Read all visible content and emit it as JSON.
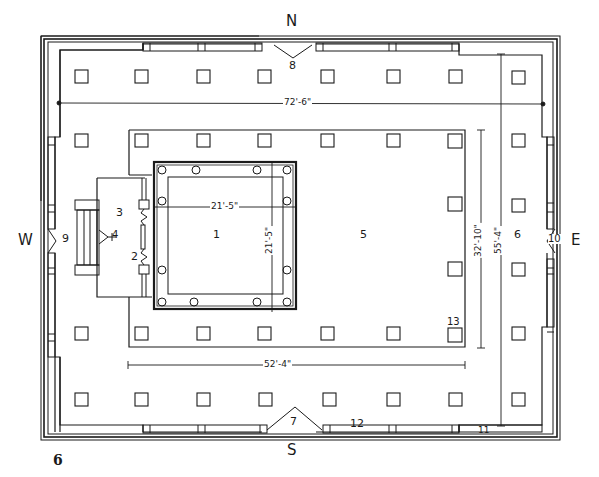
{
  "figure": {
    "figure_number": "6"
  },
  "compass": {
    "north": "N",
    "south": "S",
    "east": "E",
    "west": "W"
  },
  "rooms": [
    {
      "id": "1",
      "label": "1",
      "note": "sanctum (square chamber with columns)"
    },
    {
      "id": "2",
      "label": "2"
    },
    {
      "id": "3",
      "label": "3"
    },
    {
      "id": "4",
      "label": "4"
    },
    {
      "id": "5",
      "label": "5"
    },
    {
      "id": "6",
      "label": "6"
    },
    {
      "id": "7",
      "label": "7"
    },
    {
      "id": "8",
      "label": "8"
    },
    {
      "id": "9",
      "label": "9"
    },
    {
      "id": "10",
      "label": "10"
    },
    {
      "id": "11",
      "label": "11"
    },
    {
      "id": "12",
      "label": "12"
    },
    {
      "id": "13",
      "label": "13"
    }
  ],
  "dimensions": {
    "overall_width": "72'-6\"",
    "overall_depth": "55'-4\"",
    "inner_hall_width": "52'-4\"",
    "inner_hall_depth": "32'-10\"",
    "sanctum_width": "21'-5\"",
    "sanctum_depth": "21'-5\""
  },
  "pillars": {
    "columns_x": [
      82,
      141,
      203,
      265,
      327,
      393,
      455,
      518
    ],
    "rows_y": [
      77,
      140,
      205,
      270,
      333,
      395
    ]
  },
  "colors": {
    "ink": "#1a1a1a",
    "paper": "#ffffff"
  }
}
